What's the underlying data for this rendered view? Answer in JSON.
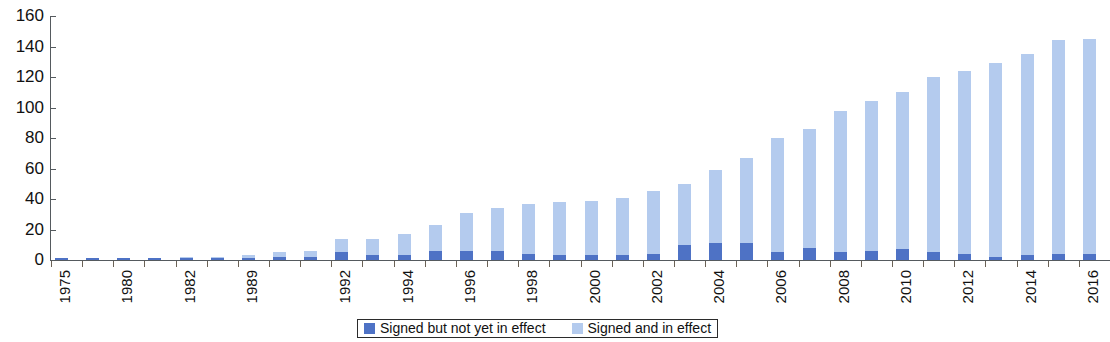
{
  "chart_data": {
    "type": "bar",
    "subtype": "stacked",
    "title": "",
    "subtitle": "",
    "xlabel": "",
    "ylabel": "",
    "ylim": [
      0,
      160
    ],
    "y_ticks": [
      0,
      20,
      40,
      60,
      80,
      100,
      120,
      140,
      160
    ],
    "grid": false,
    "legend_position": "bottom-center",
    "categories": [
      "1975",
      "1979",
      "1980",
      "1981",
      "1982",
      "1987",
      "1989",
      "1990",
      "1991",
      "1992",
      "1993",
      "1994",
      "1995",
      "1996",
      "1997",
      "1998",
      "1999",
      "2000",
      "2001",
      "2002",
      "2003",
      "2004",
      "2005",
      "2006",
      "2007",
      "2008",
      "2009",
      "2010",
      "2011",
      "2012",
      "2013",
      "2014",
      "2015",
      "2016"
    ],
    "x_tick_labels": [
      "1975",
      "",
      "1980",
      "",
      "1982",
      "",
      "1989",
      "",
      "",
      "1992",
      "",
      "1994",
      "",
      "1996",
      "",
      "1998",
      "",
      "2000",
      "",
      "2002",
      "",
      "2004",
      "",
      "2006",
      "",
      "2008",
      "",
      "2010",
      "",
      "2012",
      "",
      "2014",
      "",
      "2016"
    ],
    "series": [
      {
        "name": "Signed but not yet in effect",
        "color": "#4e72c5",
        "values": [
          1,
          1,
          1,
          1,
          1,
          1,
          1,
          2,
          2,
          5,
          3,
          3,
          6,
          6,
          6,
          4,
          3,
          3,
          3,
          4,
          10,
          11,
          11,
          5,
          8,
          5,
          6,
          7,
          5,
          4,
          2,
          3,
          4,
          4
        ]
      },
      {
        "name": "Signed and in effect",
        "color": "#b4cbee",
        "values": [
          0,
          0,
          0,
          0,
          1,
          1,
          2,
          3,
          4,
          9,
          11,
          14,
          17,
          25,
          28,
          33,
          35,
          36,
          38,
          41,
          40,
          48,
          56,
          75,
          78,
          93,
          98,
          103,
          115,
          120,
          127,
          132,
          140,
          141
        ]
      }
    ],
    "totals": [
      1,
      1,
      1,
      1,
      2,
      2,
      3,
      5,
      6,
      14,
      14,
      17,
      23,
      31,
      34,
      37,
      38,
      39,
      41,
      45,
      50,
      59,
      67,
      80,
      86,
      98,
      104,
      110,
      120,
      124,
      129,
      135,
      144,
      145
    ]
  },
  "legend": {
    "items": [
      {
        "label": "Signed but not yet in effect",
        "color": "#4e72c5"
      },
      {
        "label": "Signed and in effect",
        "color": "#b4cbee"
      }
    ]
  }
}
